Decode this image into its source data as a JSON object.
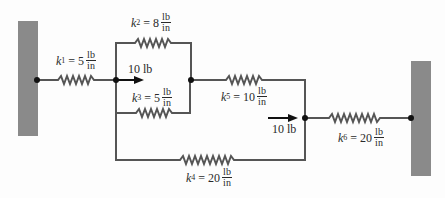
{
  "diagram": {
    "type": "spring-network",
    "colors": {
      "wire": "#555555",
      "wall": "#8a8a8a",
      "node": "#111111",
      "text": "#2a2a2a"
    },
    "walls": [
      {
        "id": "left-wall"
      },
      {
        "id": "right-wall"
      }
    ],
    "springs": [
      {
        "id": "k1",
        "symbol": "k",
        "sub": "1",
        "value": "5",
        "num": "lb",
        "den": "in"
      },
      {
        "id": "k2",
        "symbol": "k",
        "sub": "2",
        "value": "8",
        "num": "lb",
        "den": "in"
      },
      {
        "id": "k3",
        "symbol": "k",
        "sub": "3",
        "value": "5",
        "num": "lb",
        "den": "in"
      },
      {
        "id": "k4",
        "symbol": "k",
        "sub": "4",
        "value": "20",
        "num": "lb",
        "den": "in"
      },
      {
        "id": "k5",
        "symbol": "k",
        "sub": "5",
        "value": "10",
        "num": "lb",
        "den": "in"
      },
      {
        "id": "k6",
        "symbol": "k",
        "sub": "6",
        "value": "20",
        "num": "lb",
        "den": "in"
      }
    ],
    "forces": [
      {
        "id": "force-1",
        "label": "10 lb",
        "direction": "right"
      },
      {
        "id": "force-2",
        "label": "10 lb",
        "direction": "right"
      }
    ],
    "eq": " = "
  }
}
